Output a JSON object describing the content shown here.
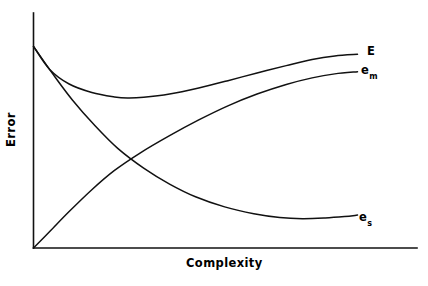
{
  "chart_data": {
    "type": "line",
    "title": "",
    "subtitle": "",
    "xlabel": "Complexity",
    "ylabel": "Error",
    "grid": false,
    "legend_position": "inline-right-end-of-curve",
    "axis_style": "open-left-bottom-no-ticks",
    "xlim": [
      0,
      1
    ],
    "ylim": [
      0,
      1
    ],
    "x_tick_labels": [],
    "y_tick_labels": [],
    "annotations": [
      {
        "id": "E",
        "text": "E",
        "subscript": "",
        "meaning": "total error (sum of approximation and estimation error)",
        "x": 0.86,
        "y": 0.82
      },
      {
        "id": "e_m",
        "text": "e",
        "subscript": "m",
        "meaning": "model / approximation error",
        "x": 0.85,
        "y": 0.74
      },
      {
        "id": "e_s",
        "text": "e",
        "subscript": "s",
        "meaning": "estimation / statistical error",
        "x": 0.85,
        "y": 0.12
      }
    ],
    "series": [
      {
        "name": "E",
        "label": "E",
        "subscript": "",
        "shape": "u-shaped-then-rising",
        "color": "#111111",
        "points": [
          {
            "x": 0.0,
            "y": 0.858
          },
          {
            "x": 0.05,
            "y": 0.76
          },
          {
            "x": 0.11,
            "y": 0.698
          },
          {
            "x": 0.18,
            "y": 0.662
          },
          {
            "x": 0.25,
            "y": 0.643
          },
          {
            "x": 0.29,
            "y": 0.638
          },
          {
            "x": 0.34,
            "y": 0.641
          },
          {
            "x": 0.42,
            "y": 0.655
          },
          {
            "x": 0.51,
            "y": 0.681
          },
          {
            "x": 0.6,
            "y": 0.712
          },
          {
            "x": 0.69,
            "y": 0.745
          },
          {
            "x": 0.78,
            "y": 0.776
          },
          {
            "x": 0.86,
            "y": 0.802
          },
          {
            "x": 0.93,
            "y": 0.817
          },
          {
            "x": 1.0,
            "y": 0.824
          }
        ]
      },
      {
        "name": "e_m",
        "label": "e",
        "subscript": "m",
        "shape": "monotonically-increasing-concave",
        "color": "#111111",
        "points": [
          {
            "x": 0.0,
            "y": 0.0
          },
          {
            "x": 0.05,
            "y": 0.07
          },
          {
            "x": 0.11,
            "y": 0.155
          },
          {
            "x": 0.18,
            "y": 0.248
          },
          {
            "x": 0.25,
            "y": 0.33
          },
          {
            "x": 0.33,
            "y": 0.405
          },
          {
            "x": 0.42,
            "y": 0.478
          },
          {
            "x": 0.51,
            "y": 0.545
          },
          {
            "x": 0.6,
            "y": 0.605
          },
          {
            "x": 0.69,
            "y": 0.655
          },
          {
            "x": 0.78,
            "y": 0.696
          },
          {
            "x": 0.86,
            "y": 0.724
          },
          {
            "x": 0.93,
            "y": 0.741
          },
          {
            "x": 1.0,
            "y": 0.75
          }
        ]
      },
      {
        "name": "e_s",
        "label": "e",
        "subscript": "s",
        "shape": "monotonically-decreasing-convex",
        "color": "#111111",
        "points": [
          {
            "x": 0.0,
            "y": 0.858
          },
          {
            "x": 0.06,
            "y": 0.74
          },
          {
            "x": 0.12,
            "y": 0.63
          },
          {
            "x": 0.19,
            "y": 0.52
          },
          {
            "x": 0.26,
            "y": 0.424
          },
          {
            "x": 0.34,
            "y": 0.34
          },
          {
            "x": 0.42,
            "y": 0.272
          },
          {
            "x": 0.5,
            "y": 0.218
          },
          {
            "x": 0.59,
            "y": 0.175
          },
          {
            "x": 0.68,
            "y": 0.146
          },
          {
            "x": 0.76,
            "y": 0.13
          },
          {
            "x": 0.83,
            "y": 0.125
          },
          {
            "x": 0.9,
            "y": 0.128
          },
          {
            "x": 0.96,
            "y": 0.134
          },
          {
            "x": 1.0,
            "y": 0.14
          }
        ]
      }
    ],
    "crossing_point": {
      "x": 0.26,
      "y": 0.424,
      "series": [
        "e_m",
        "e_s"
      ]
    },
    "minimum_of_total_error": {
      "x": 0.29,
      "y": 0.638,
      "series": "E"
    }
  },
  "axes": {
    "y_axis_label": "Error",
    "x_axis_label": "Complexity"
  },
  "labels": {
    "E": "E",
    "e_base": "e",
    "e_m_sub": "m",
    "e_s_sub": "s"
  },
  "colors": {
    "background": "#ffffff",
    "ink": "#111111"
  }
}
